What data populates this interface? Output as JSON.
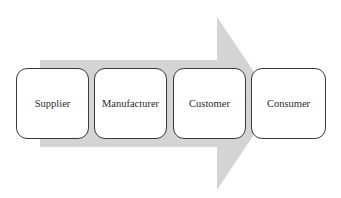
{
  "diagram": {
    "type": "process-flow",
    "arrow": {
      "color": "#d4d4d4",
      "direction": "right"
    },
    "steps": [
      {
        "label": "Supplier"
      },
      {
        "label": "Manufacturer"
      },
      {
        "label": "Customer"
      },
      {
        "label": "Consumer"
      }
    ]
  }
}
